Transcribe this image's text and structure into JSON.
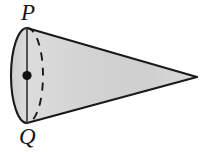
{
  "figure": {
    "type": "geometry-diagram",
    "shape_name": "cone",
    "background_color": "#ffffff",
    "canvas": {
      "width": 205,
      "height": 152
    }
  },
  "labels": {
    "top_vertex": "P",
    "bottom_vertex": "Q"
  },
  "colors": {
    "outline": "#1a1a1a",
    "body_fill_light": "#e6e6e6",
    "body_fill_dark": "#c9c9c9",
    "base_fill": "#d6d6d6",
    "center_dot": "#111111",
    "hidden_edge": "#1a1a1a"
  },
  "geometry": {
    "apex": {
      "x": 197,
      "y": 77
    },
    "base_center": {
      "x": 27,
      "y": 75.5
    },
    "base_top_point_P": {
      "x": 27,
      "y": 28
    },
    "base_bottom_point_Q": {
      "x": 27,
      "y": 123
    },
    "base_ellipse_rx": 16,
    "base_ellipse_ry": 47.5,
    "front_arc_style": "solid",
    "back_arc_style": "dashed",
    "diameter_line_style": "solid",
    "center_dot_radius": 4.5
  }
}
